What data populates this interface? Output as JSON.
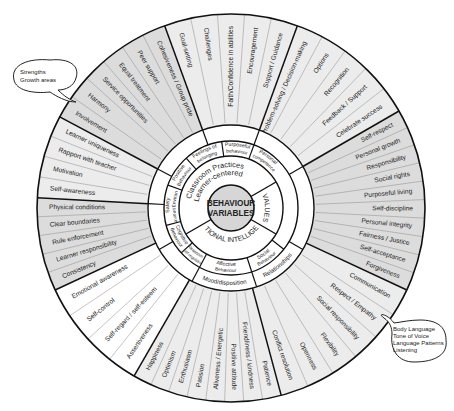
{
  "center": {
    "line1": "BEHAVIOUR",
    "line2": "VARIABLES"
  },
  "colors": {
    "shaded": "#dcdcdc",
    "light": "#ececec",
    "white": "#ffffff",
    "line": "#111111",
    "thin": "#8a8a8a",
    "hub": "#d6d6d6"
  },
  "ring2": [
    {
      "label": "Classroom Practices",
      "label2": "Learner-centered",
      "start": 150,
      "end": 330
    },
    {
      "label": "VALUES",
      "start": 330,
      "end": 30
    },
    {
      "label": "EMOTIONAL INTELLIGENCE",
      "start": 30,
      "end": 150
    }
  ],
  "ring3": [
    {
      "label": "Safety",
      "label2": "Behaviour/Environment",
      "start": 165,
      "end": 200
    },
    {
      "label": "Positive",
      "label2": "Behaviour",
      "start": 200,
      "end": 228
    },
    {
      "label": "Feelings of",
      "label2": "belonging",
      "start": 228,
      "end": 262
    },
    {
      "label": "Purposeful",
      "label2": "behaviour",
      "start": 262,
      "end": 290
    },
    {
      "label": "Personal",
      "label2": "competence",
      "start": 290,
      "end": 322
    },
    {
      "label": "Cognitive",
      "label2": "Behaviour",
      "start": 138,
      "end": 165
    },
    {
      "label": "Affective",
      "label2": "Behaviour",
      "start": 72,
      "end": 118
    },
    {
      "label": "Social",
      "label2": "Behaviour",
      "start": 38,
      "end": 72
    },
    {
      "label": "Reasoning",
      "label2": "Self-regulation",
      "start": 118,
      "end": 138
    }
  ],
  "ring4": [
    {
      "label": "Mood/disposition",
      "start": 72,
      "end": 118
    },
    {
      "label": "Relationships",
      "start": 30,
      "end": 72
    }
  ],
  "sectors": [
    {
      "name": "safety",
      "start": 155,
      "end": 183,
      "shade": "shaded",
      "items": [
        "Consistency",
        "Learner responsibility",
        "Rule enforcement",
        "Clear boundaries",
        "Physical conditions"
      ]
    },
    {
      "name": "positive",
      "start": 183,
      "end": 208,
      "shade": "light",
      "items": [
        "Self-awareness",
        "Motivation",
        "Rapport with teacher",
        "Learner uniqueness"
      ],
      "reverse": true
    },
    {
      "name": "belonging",
      "start": 208,
      "end": 250,
      "shade": "shaded",
      "items": [
        "Involvement",
        "Harmony",
        "Service opportunities",
        "Equal treatment",
        "Peer support",
        "Cohesiveness / Group pride"
      ]
    },
    {
      "name": "purpose",
      "start": 250,
      "end": 290,
      "shade": "light",
      "items": [
        "Goal-setting",
        "Challenges",
        "Faith/Confidence in abilities",
        "Encouragement",
        "Support / Guidance"
      ]
    },
    {
      "name": "competence",
      "start": 290,
      "end": 330,
      "shade": "light",
      "items": [
        "Problem-solving / Decision-making",
        "Options",
        "Recognition",
        "Feedback / Support",
        "Celebrate success"
      ]
    },
    {
      "name": "values",
      "start": 330,
      "end": 385,
      "shade": "shaded",
      "items": [
        "Self-respect",
        "Personal growth",
        "Responsibility",
        "Social rights",
        "Purposeful living",
        "Self-discipline",
        "Personal integrity",
        "Fairness / Justice",
        "Self-acceptance",
        "Forgiveness"
      ]
    },
    {
      "name": "social",
      "start": 25,
      "end": 75,
      "shade": "light",
      "items": [
        "Communication",
        "Respect / Empathy",
        "Social responsibility",
        "Flexibility",
        "Openness",
        "Conflict resolution"
      ]
    },
    {
      "name": "affective",
      "start": 75,
      "end": 120,
      "shade": "light",
      "items": [
        "Patience",
        "Friendliness / kindness",
        "Positive attitude",
        "Aliveness / Energetic",
        "Passion",
        "Enthusiasm",
        "Optimism",
        "Happiness"
      ]
    },
    {
      "name": "cognitive",
      "start": 120,
      "end": 155,
      "shade": "white",
      "items": [
        "Assertiveness",
        "Self-regard / self-esteem",
        "Self-control",
        "Emotional awareness"
      ]
    }
  ],
  "callouts": [
    {
      "name": "strengths-callout",
      "lines": [
        "Strengths",
        "Growth areas"
      ]
    },
    {
      "name": "communication-callout",
      "lines": [
        "Body Language",
        "Tone of Voice",
        "Language Patterns",
        "Listening"
      ]
    }
  ]
}
